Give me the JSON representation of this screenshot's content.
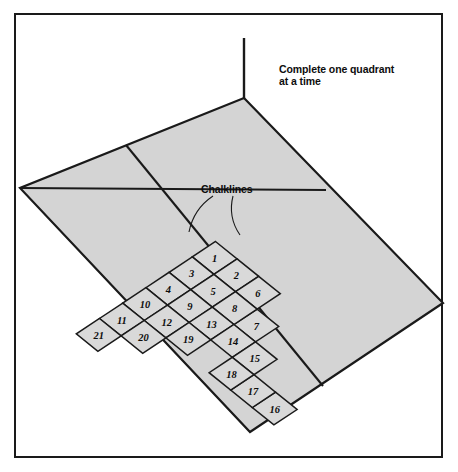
{
  "diagram": {
    "title_note": "Complete one quadrant\nat a time",
    "chalkline_label": "Chalklines",
    "colors": {
      "floor_fill": "#d4d4d4",
      "tile_fill": "#d9d9d9",
      "line": "#1a1a1a",
      "frame": "#1a1a1a",
      "background": "#ffffff",
      "text": "#0d0d0d"
    },
    "floor": {
      "shape": "parallelogram",
      "corners": [
        {
          "name": "top",
          "x": 244,
          "y": 98
        },
        {
          "name": "right",
          "x": 443,
          "y": 303
        },
        {
          "name": "bottom",
          "x": 250,
          "y": 432
        },
        {
          "name": "left",
          "x": 20,
          "y": 188
        }
      ]
    },
    "wall_line": {
      "x1": 244,
      "y1": 38,
      "x2": 244,
      "y2": 98
    },
    "chalklines": [
      {
        "name": "chalkline-a",
        "x1": 20,
        "y1": 188,
        "x2": 326,
        "y2": 190
      },
      {
        "name": "chalkline-b",
        "x1": 126,
        "y1": 145,
        "x2": 323,
        "y2": 386
      }
    ],
    "leaders": [
      {
        "name": "leader-left",
        "from_x": 213,
        "from_y": 196,
        "to_x": 189,
        "to_y": 232
      },
      {
        "name": "leader-right",
        "from_x": 233,
        "from_y": 196,
        "to_x": 240,
        "to_y": 235
      }
    ],
    "tiles": {
      "count": 21,
      "sequence_note": "laid in staircase order radiating from apex tile 1",
      "items": [
        {
          "n": "1",
          "col": 0,
          "row": 0
        },
        {
          "n": "2",
          "col": 1,
          "row": 0
        },
        {
          "n": "3",
          "col": -1,
          "row": 0
        },
        {
          "n": "4",
          "col": -2,
          "row": 0
        },
        {
          "n": "5",
          "col": 0,
          "row": 1
        },
        {
          "n": "6",
          "col": 2,
          "row": 0
        },
        {
          "n": "7",
          "col": 2,
          "row": 1
        },
        {
          "n": "8",
          "col": 1,
          "row": 1
        },
        {
          "n": "9",
          "col": -1,
          "row": 1
        },
        {
          "n": "10",
          "col": -3,
          "row": 0
        },
        {
          "n": "11",
          "col": -4,
          "row": 0
        },
        {
          "n": "12",
          "col": -2,
          "row": 1
        },
        {
          "n": "13",
          "col": 0,
          "row": 2
        },
        {
          "n": "14",
          "col": 1,
          "row": 2
        },
        {
          "n": "15",
          "col": 2,
          "row": 2
        },
        {
          "n": "16",
          "col": 3,
          "row": 3
        },
        {
          "n": "17",
          "col": 2,
          "row": 3
        },
        {
          "n": "18",
          "col": 1,
          "row": 3
        },
        {
          "n": "19",
          "col": -1,
          "row": 2
        },
        {
          "n": "20",
          "col": -3,
          "row": 1
        },
        {
          "n": "21",
          "col": -5,
          "row": 0
        }
      ]
    }
  }
}
